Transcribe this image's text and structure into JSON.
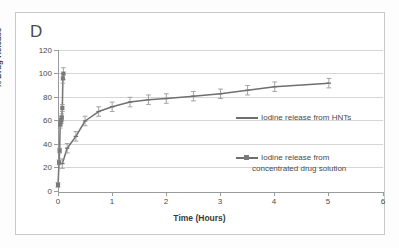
{
  "panel": {
    "letter": "D"
  },
  "chart_data": {
    "type": "line",
    "title": "",
    "subtitle": "",
    "xlabel": "Time (Hours)",
    "ylabel": "% Drug Release",
    "xlim": [
      0,
      6
    ],
    "ylim": [
      0,
      120
    ],
    "xticks": [
      0,
      1,
      2,
      3,
      4,
      5,
      6
    ],
    "yticks": [
      0,
      20,
      40,
      60,
      80,
      100,
      120
    ],
    "grid": "horizontal",
    "legend_position": "inside-right",
    "series": [
      {
        "name": "Iodine release from HNTs",
        "marker": "line-with-caps",
        "color": "#6f6f6f",
        "x": [
          0.08,
          0.17,
          0.33,
          0.5,
          0.75,
          1.0,
          1.33,
          1.67,
          2.0,
          2.5,
          3.0,
          3.5,
          4.0,
          5.0
        ],
        "y": [
          24,
          37,
          47,
          60,
          68,
          72,
          76,
          78,
          79,
          81,
          83,
          86,
          89,
          92
        ],
        "yerr": [
          4,
          4,
          4,
          4,
          4,
          4,
          4,
          4,
          4,
          4,
          4,
          4,
          4,
          4
        ]
      },
      {
        "name": "Iodine release from concentrated drug solution",
        "marker": "square",
        "color": "#7a7a7a",
        "x": [
          0,
          0.02,
          0.03,
          0.04,
          0.05,
          0.06,
          0.07,
          0.08,
          0.09,
          0.1
        ],
        "y": [
          6,
          25,
          35,
          57,
          59,
          61,
          63,
          71,
          96,
          100
        ],
        "yerr": [
          2,
          2,
          2,
          3,
          3,
          3,
          3,
          3,
          4,
          5
        ]
      }
    ],
    "legend_entries": [
      "Iodine release from HNTs",
      "Iodine release from",
      "concentrated drug solution"
    ]
  }
}
